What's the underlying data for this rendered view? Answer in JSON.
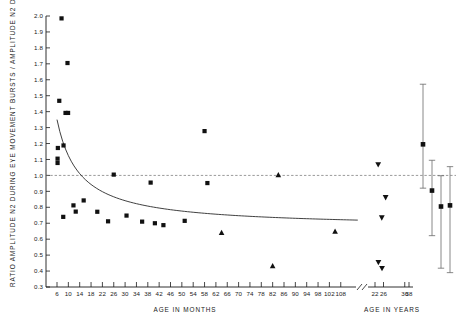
{
  "chart_data": {
    "type": "scatter",
    "title": "",
    "xlabel": "AGE IN MONTHS",
    "xlabel_secondary": "AGE IN YEARS",
    "ylabel": "RATIO AMPLITUDE N2 DURING EYE MOVEMENT BURSTS / AMPLITUDE N2 DURING STAGE 2",
    "ylim": [
      0.3,
      2.0
    ],
    "ytick_step": 0.1,
    "yticks": [
      "2.0",
      "1.9",
      "1.8",
      "1.7",
      "1.6",
      "1.5",
      "1.4",
      "1.3",
      "1.2",
      "1.1",
      "1.0",
      "0.9",
      "0.8",
      "0.7",
      "0.6",
      "0.5",
      "0.4",
      "0.3"
    ],
    "xticks_months": [
      "6",
      "10",
      "14",
      "18",
      "22",
      "26",
      "30",
      "34",
      "38",
      "42",
      "46",
      "50",
      "54",
      "58",
      "62",
      "66",
      "70",
      "74",
      "78",
      "82",
      "86",
      "90",
      "94",
      "98",
      "102",
      "108"
    ],
    "xticks_years": [
      "22",
      "26",
      "36",
      "38"
    ],
    "axis_break": true,
    "grid": false,
    "legend": "none",
    "reference_line_y": 1.0,
    "series": [
      {
        "name": "infants-children-squares",
        "marker": "square",
        "units": "months",
        "points": [
          {
            "x": 7.6,
            "y": 1.985
          },
          {
            "x": 9.7,
            "y": 1.705
          },
          {
            "x": 6.8,
            "y": 1.468
          },
          {
            "x": 9.0,
            "y": 1.392
          },
          {
            "x": 9.9,
            "y": 1.392
          },
          {
            "x": 6.3,
            "y": 1.172
          },
          {
            "x": 8.3,
            "y": 1.188
          },
          {
            "x": 6.2,
            "y": 1.105
          },
          {
            "x": 6.2,
            "y": 1.078
          },
          {
            "x": 26.0,
            "y": 1.005
          },
          {
            "x": 39.0,
            "y": 0.955
          },
          {
            "x": 58.0,
            "y": 1.278
          },
          {
            "x": 59.0,
            "y": 0.952
          },
          {
            "x": 8.2,
            "y": 0.74
          },
          {
            "x": 11.8,
            "y": 0.812
          },
          {
            "x": 12.6,
            "y": 0.773
          },
          {
            "x": 15.4,
            "y": 0.843
          },
          {
            "x": 20.2,
            "y": 0.772
          },
          {
            "x": 24.0,
            "y": 0.712
          },
          {
            "x": 30.5,
            "y": 0.748
          },
          {
            "x": 36.0,
            "y": 0.71
          },
          {
            "x": 40.5,
            "y": 0.7
          },
          {
            "x": 43.5,
            "y": 0.688
          },
          {
            "x": 51.0,
            "y": 0.715
          }
        ]
      },
      {
        "name": "adolescents-up-triangles",
        "marker": "triangle-up",
        "units": "months",
        "points": [
          {
            "x": 84.0,
            "y": 1.002
          },
          {
            "x": 64.0,
            "y": 0.64
          },
          {
            "x": 82.0,
            "y": 0.432
          },
          {
            "x": 104.0,
            "y": 0.648
          }
        ]
      },
      {
        "name": "adults-down-triangles",
        "marker": "triangle-down",
        "units": "years",
        "points": [
          {
            "x": 23.5,
            "y": 1.068
          },
          {
            "x": 27.0,
            "y": 0.862
          },
          {
            "x": 25.2,
            "y": 0.735
          },
          {
            "x": 23.6,
            "y": 0.455
          },
          {
            "x": 25.3,
            "y": 0.418
          }
        ]
      }
    ],
    "fit_curve": {
      "name": "fitted-decay-curve",
      "description": "decreasing hyperbolic fit from ratio 1.35 at 6 months asymptoting near 0.67",
      "y_start": 1.35,
      "y_end": 0.672
    },
    "summary_error_bars": {
      "name": "group-mean-error-bars",
      "bars": [
        {
          "label": "group-1",
          "mean": 1.195,
          "upper": 1.572,
          "lower": 0.92
        },
        {
          "label": "group-2",
          "mean": 0.905,
          "upper": 1.095,
          "lower": 0.622
        },
        {
          "label": "group-3",
          "mean": 0.805,
          "upper": 0.998,
          "lower": 0.418
        },
        {
          "label": "group-4",
          "mean": 0.812,
          "upper": 1.055,
          "lower": 0.39
        }
      ]
    }
  }
}
